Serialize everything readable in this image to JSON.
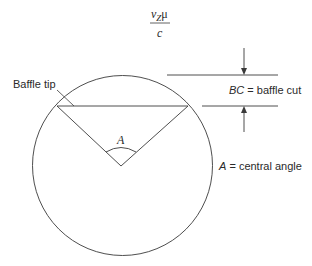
{
  "formula": {
    "numerator_v": "v",
    "numerator_sub": "Z",
    "numerator_mu": "μ",
    "denominator": "c"
  },
  "labels": {
    "baffle_tip": "Baffle tip",
    "angle_symbol": "A",
    "bc_symbol": "BC",
    "bc_text": " = baffle cut",
    "a_symbol": "A",
    "a_text": " = central angle"
  },
  "colors": {
    "line": "#3a3a3a",
    "text": "#2a2a2a",
    "background": "#ffffff"
  }
}
